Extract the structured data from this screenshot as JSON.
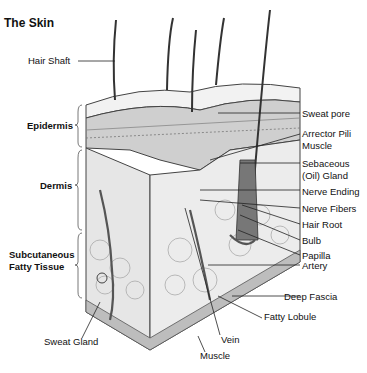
{
  "title": "The Skin",
  "left_labels": {
    "hair_shaft": "Hair Shaft",
    "epidermis": "Epidermis",
    "dermis": "Dermis",
    "subcutaneous_1": "Subcutaneous",
    "subcutaneous_2": "Fatty Tissue",
    "sweat_gland": "Sweat Gland"
  },
  "right_labels": {
    "sweat_pore": "Sweat pore",
    "arrector_1": "Arrector Pili",
    "arrector_2": "Muscle",
    "sebaceous_1": "Sebaceous",
    "sebaceous_2": "(Oil) Gland",
    "nerve_ending": "Nerve Ending",
    "nerve_fibers": "Nerve Fibers",
    "hair_root": "Hair Root",
    "bulb": "Bulb",
    "papilla": "Papilla",
    "artery": "Artery",
    "deep_fascia": "Deep Fascia",
    "fatty_lobule": "Fatty Lobule"
  },
  "bottom_labels": {
    "vein": "Vein",
    "muscle": "Muscle"
  }
}
